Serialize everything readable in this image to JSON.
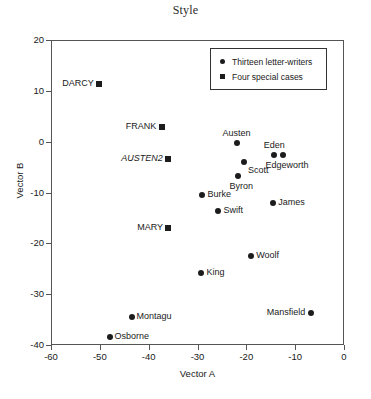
{
  "chart_data": {
    "type": "scatter",
    "title": "Style",
    "xlabel": "Vector A",
    "ylabel": "Vector B",
    "xlim": [
      -60,
      0
    ],
    "ylim": [
      -40,
      20
    ],
    "xticks": [
      -60,
      -50,
      -40,
      -30,
      -20,
      -10,
      0
    ],
    "xtick_labels": [
      "-60",
      "-50",
      "-40",
      "-30",
      "-20",
      "-10",
      "0"
    ],
    "yticks": [
      20,
      10,
      0,
      -10,
      -20,
      -30,
      -40
    ],
    "ytick_labels": [
      "20",
      "10",
      "0",
      "-10",
      "-20",
      "-30",
      "-40"
    ],
    "grid": false,
    "legend_position": "top-right",
    "series": [
      {
        "name": "Thirteen letter-writers",
        "marker": "circle",
        "color": "#1c1c1c",
        "points": [
          {
            "label": "Austen",
            "x": -22.0,
            "y": -0.3,
            "label_pos": "above"
          },
          {
            "label": "Eden",
            "x": -14.3,
            "y": -2.6,
            "label_pos": "above"
          },
          {
            "label": "Edgeworth",
            "x": -12.5,
            "y": -2.6,
            "label_pos": "below"
          },
          {
            "label": "Scott",
            "x": -20.5,
            "y": -4.0,
            "label_pos": "right-below"
          },
          {
            "label": "Byron",
            "x": -21.8,
            "y": -6.8,
            "label_pos": "below"
          },
          {
            "label": "Burke",
            "x": -29.0,
            "y": -10.4,
            "label_pos": "right"
          },
          {
            "label": "James",
            "x": -14.5,
            "y": -12.0,
            "label_pos": "right"
          },
          {
            "label": "Swift",
            "x": -25.7,
            "y": -13.6,
            "label_pos": "right"
          },
          {
            "label": "Woolf",
            "x": -19.0,
            "y": -22.4,
            "label_pos": "right"
          },
          {
            "label": "King",
            "x": -29.2,
            "y": -25.8,
            "label_pos": "right"
          },
          {
            "label": "Mansfield",
            "x": -6.8,
            "y": -33.7,
            "label_pos": "left"
          },
          {
            "label": "Montagu",
            "x": -43.5,
            "y": -34.5,
            "label_pos": "right"
          },
          {
            "label": "Osborne",
            "x": -48.0,
            "y": -38.4,
            "label_pos": "right"
          }
        ]
      },
      {
        "name": "Four special cases",
        "marker": "square",
        "color": "#1c1c1c",
        "points": [
          {
            "label": "DARCY",
            "x": -50.1,
            "y": 11.3,
            "label_pos": "left",
            "italic": false
          },
          {
            "label": "FRANK",
            "x": -37.3,
            "y": 2.8,
            "label_pos": "left",
            "italic": false
          },
          {
            "label": "AUSTEN2",
            "x": -36.0,
            "y": -3.5,
            "label_pos": "left",
            "italic": true
          },
          {
            "label": "MARY",
            "x": -36.0,
            "y": -17.0,
            "label_pos": "left",
            "italic": false
          }
        ]
      }
    ],
    "legend": [
      {
        "label": "Thirteen letter-writers",
        "marker": "circle"
      },
      {
        "label": "Four special cases",
        "marker": "square"
      }
    ]
  }
}
